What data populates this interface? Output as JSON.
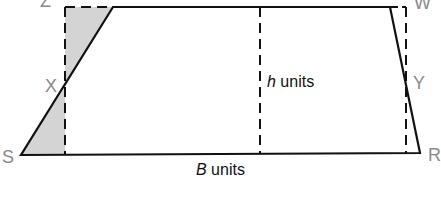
{
  "diagram": {
    "type": "trapezium-area-derivation",
    "vertices": {
      "S": {
        "label": "S",
        "x": 21,
        "y": 155
      },
      "R": {
        "label": "R",
        "x": 420,
        "y": 153
      },
      "W": {
        "label": "W",
        "x": 390,
        "y": 7
      },
      "Z": {
        "label": "Z",
        "x": 113,
        "y": 7
      }
    },
    "midpoints": {
      "X": {
        "label": "X"
      },
      "Y": {
        "label": "Y"
      }
    },
    "dimensions": {
      "height": {
        "var": "h",
        "unit": " units"
      },
      "base": {
        "var": "B",
        "unit": " units"
      }
    },
    "colors": {
      "outline": "#111111",
      "shade": "#d4d4d4",
      "label": "#8a8a8a"
    }
  }
}
